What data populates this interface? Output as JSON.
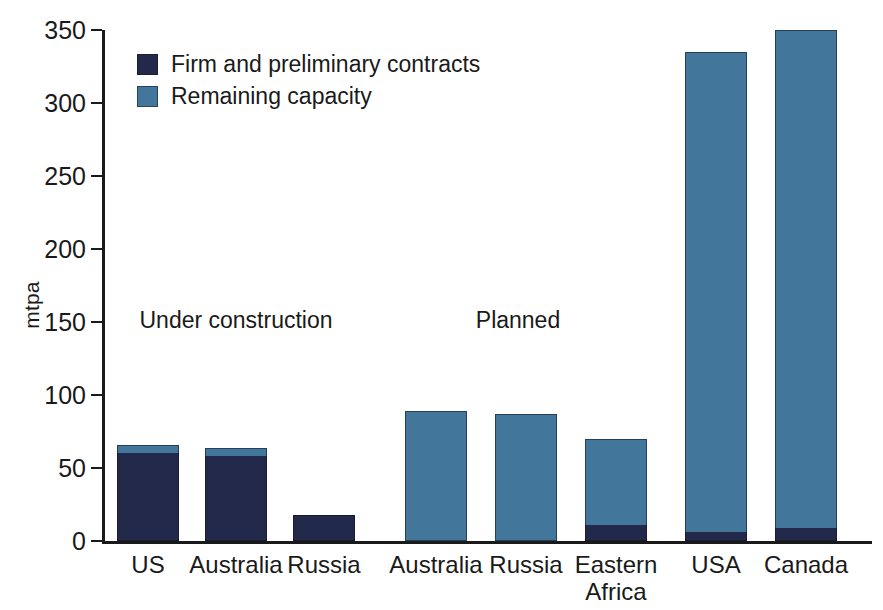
{
  "chart_data": {
    "type": "bar",
    "title": "",
    "subtitle": "",
    "xlabel": "",
    "ylabel": "mtpa",
    "ylim": [
      0,
      350
    ],
    "yticks": [
      0,
      50,
      100,
      150,
      200,
      250,
      300,
      350
    ],
    "grid": false,
    "stacked": true,
    "legend_position": "top-left",
    "categories": [
      "US",
      "Australia",
      "Russia",
      "Australia",
      "Russia",
      "Eastern\nAfrica",
      "USA",
      "Canada"
    ],
    "series": [
      {
        "name": "Firm and preliminary contracts",
        "color": "#23294a",
        "values": [
          60,
          58,
          18,
          0,
          0,
          11,
          6,
          9
        ]
      },
      {
        "name": "Remaining capacity",
        "color": "#42779b",
        "values": [
          6,
          6,
          0,
          89,
          87,
          59,
          329,
          341
        ]
      }
    ],
    "totals": [
      66,
      64,
      18,
      89,
      87,
      70,
      335,
      350
    ],
    "annotations": [
      {
        "text": "Under construction",
        "x_category_span": [
          0,
          2
        ]
      },
      {
        "text": "Planned",
        "x_category_span": [
          3,
          7
        ]
      }
    ]
  },
  "legend": {
    "items": [
      {
        "label": "Firm and preliminary contracts",
        "swatch": "firm-swatch"
      },
      {
        "label": "Remaining capacity",
        "swatch": "remaining-swatch"
      }
    ]
  },
  "colors": {
    "firm": "#23294a",
    "remaining": "#42779b",
    "axis": "#1a1a1a",
    "background": "#ffffff"
  }
}
